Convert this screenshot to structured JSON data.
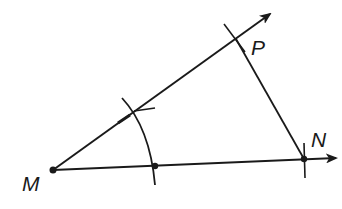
{
  "diagram": {
    "type": "geometric-construction",
    "points": {
      "M": {
        "label": "M",
        "x": 53,
        "y": 170
      },
      "N": {
        "label": "N",
        "x": 304,
        "y": 159
      },
      "P": {
        "label": "P",
        "x": 236,
        "y": 39
      },
      "arc_point": {
        "label": "",
        "x": 155,
        "y": 166
      }
    },
    "labels": {
      "M": "M",
      "N": "N",
      "P": "P"
    },
    "colors": {
      "stroke": "#1a1a1a",
      "background": "#ffffff"
    }
  }
}
